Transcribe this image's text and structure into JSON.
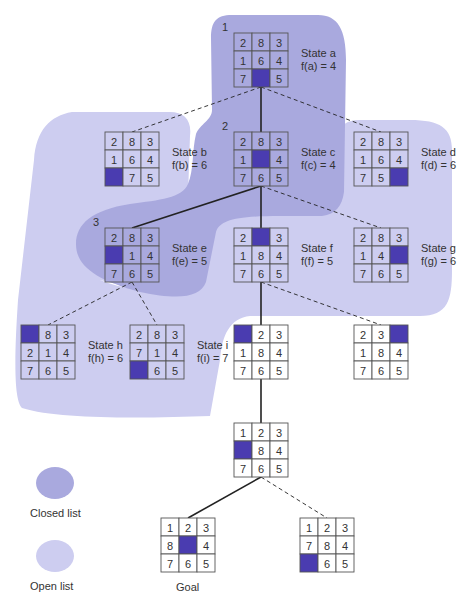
{
  "colors": {
    "closed": "#a9a9de",
    "open": "#cdcdf0",
    "blank": "#4a3cb0",
    "grid_line": "#555555",
    "edge": "#222222",
    "background": "#ffffff"
  },
  "legend": {
    "closed_label": "Closed list",
    "open_label": "Open list"
  },
  "goal_label": "Goal",
  "nodes": [
    {
      "id": "a",
      "step": "1",
      "name": "State a",
      "f": "f(a) = 4",
      "tiles": [
        "2",
        "8",
        "3",
        "1",
        "6",
        "4",
        "7",
        "",
        "5"
      ],
      "x": 234,
      "y": 33,
      "list": "closed"
    },
    {
      "id": "b",
      "step": "",
      "name": "State b",
      "f": "f(b) = 6",
      "tiles": [
        "2",
        "8",
        "3",
        "1",
        "6",
        "4",
        "",
        "7",
        "5"
      ],
      "x": 105,
      "y": 132,
      "list": "open"
    },
    {
      "id": "c",
      "step": "2",
      "name": "State c",
      "f": "f(c) = 4",
      "tiles": [
        "2",
        "8",
        "3",
        "1",
        "",
        "4",
        "7",
        "6",
        "5"
      ],
      "x": 234,
      "y": 132,
      "list": "closed"
    },
    {
      "id": "d",
      "step": "",
      "name": "State d",
      "f": "f(d) = 6",
      "tiles": [
        "2",
        "8",
        "3",
        "1",
        "6",
        "4",
        "7",
        "5",
        ""
      ],
      "x": 354,
      "y": 132,
      "list": "open"
    },
    {
      "id": "e",
      "step": "3",
      "name": "State e",
      "f": "f(e) = 5",
      "tiles": [
        "2",
        "8",
        "3",
        "",
        "1",
        "4",
        "7",
        "6",
        "5"
      ],
      "x": 105,
      "y": 228,
      "list": "closed"
    },
    {
      "id": "f",
      "step": "",
      "name": "State f",
      "f": "f(f) = 5",
      "tiles": [
        "2",
        "",
        "3",
        "1",
        "8",
        "4",
        "7",
        "6",
        "5"
      ],
      "x": 234,
      "y": 228,
      "list": "open"
    },
    {
      "id": "g",
      "step": "",
      "name": "State g",
      "f": "f(g) = 6",
      "tiles": [
        "2",
        "8",
        "3",
        "1",
        "4",
        "",
        "7",
        "6",
        "5"
      ],
      "x": 354,
      "y": 228,
      "list": "open"
    },
    {
      "id": "h",
      "step": "",
      "name": "State h",
      "f": "f(h) = 6",
      "tiles": [
        "",
        "8",
        "3",
        "2",
        "1",
        "4",
        "7",
        "6",
        "5"
      ],
      "x": 21,
      "y": 325,
      "list": "open"
    },
    {
      "id": "i",
      "step": "",
      "name": "State i",
      "f": "f(i) = 7",
      "tiles": [
        "2",
        "8",
        "3",
        "7",
        "1",
        "4",
        "",
        "6",
        "5"
      ],
      "x": 130,
      "y": 325,
      "list": "open"
    },
    {
      "id": "j",
      "step": "",
      "name": "",
      "f": "",
      "tiles": [
        "",
        "2",
        "3",
        "1",
        "8",
        "4",
        "7",
        "6",
        "5"
      ],
      "x": 234,
      "y": 325,
      "list": "none"
    },
    {
      "id": "k",
      "step": "",
      "name": "",
      "f": "",
      "tiles": [
        "2",
        "3",
        "",
        "1",
        "8",
        "4",
        "7",
        "6",
        "5"
      ],
      "x": 354,
      "y": 325,
      "list": "none"
    },
    {
      "id": "l",
      "step": "",
      "name": "",
      "f": "",
      "tiles": [
        "1",
        "2",
        "3",
        "",
        "8",
        "4",
        "7",
        "6",
        "5"
      ],
      "x": 234,
      "y": 423,
      "list": "none"
    },
    {
      "id": "goal",
      "step": "",
      "name": "",
      "f": "",
      "tiles": [
        "1",
        "2",
        "3",
        "8",
        "",
        "4",
        "7",
        "6",
        "5"
      ],
      "x": 161,
      "y": 518,
      "list": "none"
    },
    {
      "id": "m",
      "step": "",
      "name": "",
      "f": "",
      "tiles": [
        "1",
        "2",
        "3",
        "7",
        "8",
        "4",
        "",
        "6",
        "5"
      ],
      "x": 300,
      "y": 518,
      "list": "none"
    }
  ],
  "edges": [
    {
      "from": "a",
      "to": "b",
      "style": "dashed"
    },
    {
      "from": "a",
      "to": "c",
      "style": "solid"
    },
    {
      "from": "a",
      "to": "d",
      "style": "dashed"
    },
    {
      "from": "c",
      "to": "e",
      "style": "solid"
    },
    {
      "from": "c",
      "to": "f",
      "style": "solid"
    },
    {
      "from": "c",
      "to": "g",
      "style": "dashed"
    },
    {
      "from": "e",
      "to": "h",
      "style": "dashed"
    },
    {
      "from": "e",
      "to": "i",
      "style": "dashed"
    },
    {
      "from": "f",
      "to": "j",
      "style": "solid"
    },
    {
      "from": "f",
      "to": "k",
      "style": "dashed"
    },
    {
      "from": "j",
      "to": "l",
      "style": "solid"
    },
    {
      "from": "l",
      "to": "goal",
      "style": "solid"
    },
    {
      "from": "l",
      "to": "m",
      "style": "dashed"
    }
  ]
}
